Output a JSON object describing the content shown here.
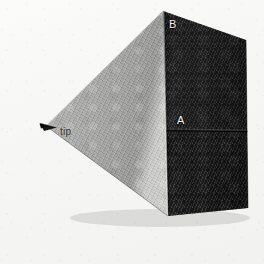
{
  "image": {
    "subject": "wedge",
    "description": "Photograph of a triangular-prism wedge block on a white background",
    "background_color": "#f7f7f5",
    "width": 264,
    "height": 264
  },
  "labels": {
    "top_vertex": "B",
    "mid_edge": "A",
    "apex": "tip"
  },
  "faces": {
    "slanted_top": {
      "name": "slanted-top-face",
      "color": "#9a9a9a",
      "highlight_color": "#b6b6b4",
      "shadow_color": "#7c7c7a"
    },
    "front_upper": {
      "name": "front-upper-face",
      "color": "#232323",
      "highlight_color": "#353535"
    },
    "front_lower": {
      "name": "front-lower-face",
      "color": "#1d1d1d",
      "highlight_color": "#2c2c2c"
    }
  },
  "geometry": {
    "apex_point": [
      46,
      126
    ],
    "top_vertex": [
      163,
      11
    ],
    "top_right": [
      246,
      40
    ],
    "mid_edge_left": [
      166,
      130
    ],
    "mid_edge_right": [
      247,
      131
    ],
    "bottom_left": [
      168,
      216
    ],
    "bottom_right": [
      248,
      208
    ],
    "slant_bottom": [
      168,
      216
    ]
  }
}
